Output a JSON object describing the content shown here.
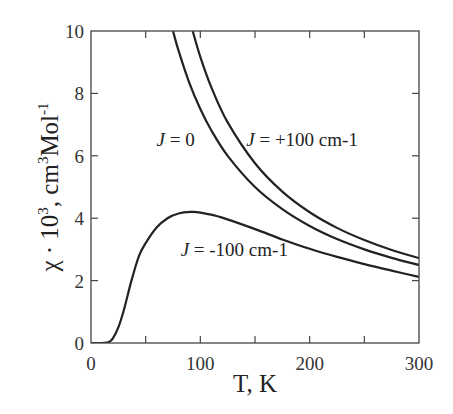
{
  "chart_data": {
    "type": "line",
    "title": "",
    "xlabel": "T, K",
    "ylabel": {
      "prefix": "χ · 10",
      "exp1": "3",
      "middle": ", cm",
      "exp2": "3",
      "suffix": "Mol",
      "exp3": "-1"
    },
    "xlim": [
      0,
      300
    ],
    "ylim": [
      0,
      10
    ],
    "xticks": [
      0,
      100,
      200,
      300
    ],
    "xminor_ticks": [
      50,
      150,
      250
    ],
    "yticks": [
      0,
      2,
      4,
      6,
      8,
      10
    ],
    "grid": false,
    "legend": "none",
    "series": [
      {
        "name": "J = 0",
        "label_italic": "J",
        "label_rest": " = 0",
        "x": [
          75,
          80,
          90,
          100,
          110,
          125,
          150,
          175,
          200,
          225,
          250,
          275,
          300
        ],
        "y": [
          10.0,
          9.38,
          8.33,
          7.5,
          6.82,
          6.0,
          5.0,
          4.29,
          3.75,
          3.33,
          3.0,
          2.73,
          2.5
        ]
      },
      {
        "name": "J = +100 cm-1",
        "label_italic": "J",
        "label_rest": " = +100 cm-1",
        "x": [
          93,
          100,
          110,
          125,
          150,
          175,
          200,
          225,
          250,
          275,
          300
        ],
        "y": [
          10.0,
          9.17,
          8.2,
          7.07,
          5.76,
          4.85,
          4.19,
          3.69,
          3.3,
          2.98,
          2.72
        ]
      },
      {
        "name": "J = -100 cm-1",
        "label_italic": "J",
        "label_rest": " = -100 cm-1",
        "x": [
          0,
          10,
          16,
          20,
          25,
          30,
          37,
          44,
          50,
          60,
          70,
          80,
          91,
          100,
          120,
          150,
          175,
          200,
          225,
          250,
          275,
          300
        ],
        "y": [
          0,
          0,
          0.02,
          0.15,
          0.5,
          1.05,
          2.0,
          2.8,
          3.2,
          3.7,
          4.0,
          4.15,
          4.2,
          4.18,
          4.02,
          3.65,
          3.32,
          3.02,
          2.76,
          2.53,
          2.32,
          2.12
        ]
      }
    ],
    "annotations": [
      {
        "series": 0,
        "text_italic": "J",
        "text_rest": " = 0",
        "x": 60,
        "y": 6.3
      },
      {
        "series": 1,
        "text_italic": "J",
        "text_rest": " = +100 cm-1",
        "x": 142,
        "y": 6.3
      },
      {
        "series": 2,
        "text_italic": "J",
        "text_rest": " = -100 cm-1",
        "x": 82,
        "y": 2.8
      }
    ]
  }
}
